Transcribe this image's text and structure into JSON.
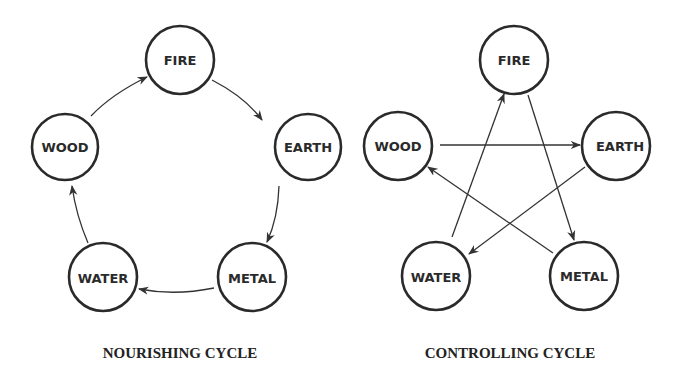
{
  "diagrams": [
    {
      "caption": "NOURISHING CYCLE",
      "nodes": [
        {
          "label": "FIRE",
          "cx": 180,
          "cy": 60
        },
        {
          "label": "EARTH",
          "cx": 308,
          "cy": 147
        },
        {
          "label": "METAL",
          "cx": 252,
          "cy": 277
        },
        {
          "label": "WATER",
          "cx": 103,
          "cy": 277
        },
        {
          "label": "WOOD",
          "cx": 65,
          "cy": 147
        }
      ],
      "edges": [
        {
          "from": "WOOD",
          "to": "FIRE"
        },
        {
          "from": "FIRE",
          "to": "EARTH"
        },
        {
          "from": "EARTH",
          "to": "METAL"
        },
        {
          "from": "METAL",
          "to": "WATER"
        },
        {
          "from": "WATER",
          "to": "WOOD"
        }
      ]
    },
    {
      "caption": "CONTROLLING CYCLE",
      "nodes": [
        {
          "label": "FIRE",
          "cx": 514,
          "cy": 60
        },
        {
          "label": "EARTH",
          "cx": 616,
          "cy": 146
        },
        {
          "label": "METAL",
          "cx": 584,
          "cy": 276
        },
        {
          "label": "WATER",
          "cx": 436,
          "cy": 276
        },
        {
          "label": "WOOD",
          "cx": 398,
          "cy": 146
        }
      ],
      "edges": [
        {
          "from": "WOOD",
          "to": "EARTH"
        },
        {
          "from": "EARTH",
          "to": "WATER"
        },
        {
          "from": "WATER",
          "to": "FIRE"
        },
        {
          "from": "FIRE",
          "to": "METAL"
        },
        {
          "from": "METAL",
          "to": "WOOD"
        }
      ]
    }
  ]
}
